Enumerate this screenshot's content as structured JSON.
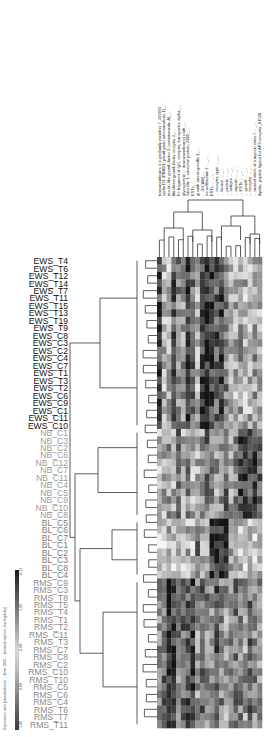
{
  "chart_data": {
    "type": "heatmap",
    "title": "",
    "orientation": "rotated-figure",
    "heatmap_box": {
      "x": 157,
      "y": 257,
      "width": 105,
      "height": 471
    },
    "rows": [
      {
        "label": "EWS_T4",
        "group": "EWS"
      },
      {
        "label": "EWS_T6",
        "group": "EWS"
      },
      {
        "label": "EWS_T12",
        "group": "EWS"
      },
      {
        "label": "EWS_T14",
        "group": "EWS"
      },
      {
        "label": "EWS_T7",
        "group": "EWS"
      },
      {
        "label": "EWS_T11",
        "group": "EWS"
      },
      {
        "label": "EWS_T15",
        "group": "EWS"
      },
      {
        "label": "EWS_T13",
        "group": "EWS"
      },
      {
        "label": "EWS_T19",
        "group": "EWS"
      },
      {
        "label": "EWS_T9",
        "group": "EWS"
      },
      {
        "label": "EWS_C8",
        "group": "EWS"
      },
      {
        "label": "EWS_C3",
        "group": "EWS"
      },
      {
        "label": "EWS_C2",
        "group": "EWS"
      },
      {
        "label": "EWS_C4",
        "group": "EWS"
      },
      {
        "label": "EWS_C7",
        "group": "EWS"
      },
      {
        "label": "EWS_T1",
        "group": "EWS"
      },
      {
        "label": "EWS_T3",
        "group": "EWS"
      },
      {
        "label": "EWS_T2",
        "group": "EWS"
      },
      {
        "label": "EWS_C6",
        "group": "EWS"
      },
      {
        "label": "EWS_C9",
        "group": "EWS"
      },
      {
        "label": "EWS_C1",
        "group": "EWS"
      },
      {
        "label": "EWS_C11",
        "group": "EWS"
      },
      {
        "label": "EWS_C10",
        "group": "EWS"
      },
      {
        "label": "NB_C1",
        "group": "NB"
      },
      {
        "label": "NB_C3",
        "group": "NB"
      },
      {
        "label": "NB_C2",
        "group": "NB"
      },
      {
        "label": "NB_C6",
        "group": "NB"
      },
      {
        "label": "NB_C12",
        "group": "NB"
      },
      {
        "label": "NB_C7",
        "group": "NB"
      },
      {
        "label": "NB_C11",
        "group": "NB"
      },
      {
        "label": "NB_C4",
        "group": "NB"
      },
      {
        "label": "NB_C5",
        "group": "NB"
      },
      {
        "label": "NB_C9",
        "group": "NB"
      },
      {
        "label": "NB_C10",
        "group": "NB"
      },
      {
        "label": "NB_C8",
        "group": "NB"
      },
      {
        "label": "BL_C5",
        "group": "BL"
      },
      {
        "label": "BL_C6",
        "group": "BL"
      },
      {
        "label": "BL_C7",
        "group": "BL"
      },
      {
        "label": "BL_C1",
        "group": "BL"
      },
      {
        "label": "BL_C2",
        "group": "BL"
      },
      {
        "label": "BL_C3",
        "group": "BL"
      },
      {
        "label": "BL_C8",
        "group": "BL"
      },
      {
        "label": "BL_C4",
        "group": "BL"
      },
      {
        "label": "RMS_C9",
        "group": "RMS"
      },
      {
        "label": "RMS_C3",
        "group": "RMS"
      },
      {
        "label": "RMS_T8",
        "group": "RMS"
      },
      {
        "label": "RMS_T5",
        "group": "RMS"
      },
      {
        "label": "RMS_T4",
        "group": "RMS"
      },
      {
        "label": "RMS_T1",
        "group": "RMS"
      },
      {
        "label": "RMS_T2",
        "group": "RMS"
      },
      {
        "label": "RMS_C11",
        "group": "RMS"
      },
      {
        "label": "RMS_T3",
        "group": "RMS"
      },
      {
        "label": "RMS_C7",
        "group": "RMS"
      },
      {
        "label": "RMS_C8",
        "group": "RMS"
      },
      {
        "label": "RMS_C2",
        "group": "RMS"
      },
      {
        "label": "RMS_C10",
        "group": "RMS"
      },
      {
        "label": "RMS_T10",
        "group": "RMS"
      },
      {
        "label": "RMS_C5",
        "group": "RMS"
      },
      {
        "label": "RMS_C6",
        "group": "RMS"
      },
      {
        "label": "RMS_C4",
        "group": "RMS"
      },
      {
        "label": "RMS_T6",
        "group": "RMS"
      },
      {
        "label": "RMS_T7",
        "group": "RMS"
      },
      {
        "label": "RMS_T11",
        "group": "RMS"
      }
    ],
    "group_colors": {
      "EWS": "#111111",
      "NB": "#9a9a9a",
      "BL": "#7a7a7a",
      "RMS": "#8a8a8a"
    },
    "columns": [
      "transmembrane 4 superfamily member 7_490056",
      "cyclin D1 (PRAD1: parathyroid adenomatosis 1)_...",
      "insulin-like growth factor 2 (somatomedin A)_...",
      "fibroblast growth factor receptor 4_...",
      "Fc fragment of IgG, receptor, transporter, alpha_...",
      "glycoprotein ... (transmembrane) nmb_...",
      "caveolin 1, caveolae protein, 22kD_...",
      "ESTs_...",
      "growth arrest-specific 1_...",
      "... (NCAM)_...",
      "neurofibromin 2 ... _...",
      "ESTs, ... _...",
      "... receptor, type ... _...",
      "... kinase ... _...",
      "... protein ... _...",
      "... antigen ... _...",
      "... myosin ... _...",
      "... ESTs ... _...",
      "... growth ... _...",
      "... receptor ... _...",
      "... mutant allele of a myosin class I ... _...",
      "Apelin; peptide ligand for APJ receptor_81518"
    ],
    "column_labels_legibility": "partially legible (rotated, low resolution)",
    "legend": {
      "ticks": [
        "-4.12",
        "-1.06",
        "-0.68",
        "0.68",
        "1.06",
        "4.12"
      ],
      "caption": "Expression ratio (standardized) ... from 1000 ... (rotated caption, low legibility)",
      "gradient": [
        "#ffffff",
        "#1a1a1a"
      ]
    },
    "group_base_patterns": {
      "EWS": [
        0.8,
        0.3,
        0.3,
        0.7,
        0.5,
        0.4,
        0.8,
        0.6,
        0.3,
        0.8,
        0.9,
        0.8,
        0.7,
        0.8,
        0.5,
        0.3,
        0.3,
        0.4,
        0.3,
        0.3,
        0.4,
        0.3
      ],
      "NB": [
        0.3,
        0.3,
        0.4,
        0.3,
        0.6,
        0.3,
        0.5,
        0.3,
        0.3,
        0.4,
        0.6,
        0.5,
        0.4,
        0.5,
        0.6,
        0.4,
        0.5,
        0.8,
        0.8,
        0.7,
        0.8,
        0.7
      ],
      "BL": [
        0.2,
        0.2,
        0.3,
        0.2,
        0.3,
        0.2,
        0.3,
        0.2,
        0.6,
        0.4,
        0.3,
        0.8,
        0.9,
        0.9,
        0.9,
        0.3,
        0.3,
        0.3,
        0.2,
        0.2,
        0.2,
        0.3
      ],
      "RMS": [
        0.5,
        0.6,
        0.9,
        0.8,
        0.5,
        0.6,
        0.7,
        0.8,
        0.4,
        0.6,
        0.5,
        0.4,
        0.7,
        0.5,
        0.4,
        0.5,
        0.6,
        0.5,
        0.4,
        0.6,
        0.5,
        0.4
      ]
    },
    "seed": 1337
  }
}
